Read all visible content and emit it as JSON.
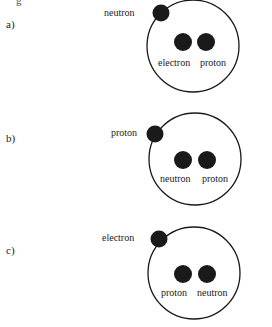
{
  "question": {
    "cropped_top_text": "g"
  },
  "options": [
    {
      "label": "a)",
      "outer_particle": "neutron",
      "inner_left": "electron",
      "inner_right": "proton"
    },
    {
      "label": "b)",
      "outer_particle": "proton",
      "inner_left": "neutron",
      "inner_right": "proton"
    },
    {
      "label": "c)",
      "outer_particle": "electron",
      "inner_left": "proton",
      "inner_right": "neutron"
    }
  ],
  "colors": {
    "ink": "#1a1a1a",
    "background": "#ffffff"
  }
}
